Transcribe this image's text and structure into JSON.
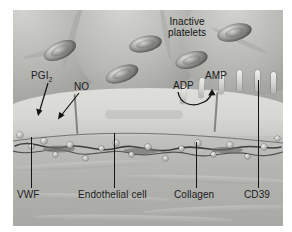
{
  "figure": {
    "style": "grayscale biomedical illustration",
    "background_color": "#ffffff",
    "plate_color": "#b9b9b7"
  },
  "labels": {
    "inactive_platelets_line1": "Inactive",
    "inactive_platelets_line2": "platelets",
    "pgi2_text": "PGI",
    "pgi2_sub": "2",
    "no": "NO",
    "adp": "ADP",
    "amp": "AMP",
    "vwf": "VWF",
    "endothelial_cell": "Endothelial cell",
    "collagen": "Collagen",
    "cd39": "CD39"
  },
  "annotations": {
    "conversion_note": "ADP converted to AMP by CD39",
    "arrow_color": "#141414"
  },
  "elements": {
    "platelet_count": 5,
    "cd39_peg_count": 6,
    "bead_count": 18
  }
}
